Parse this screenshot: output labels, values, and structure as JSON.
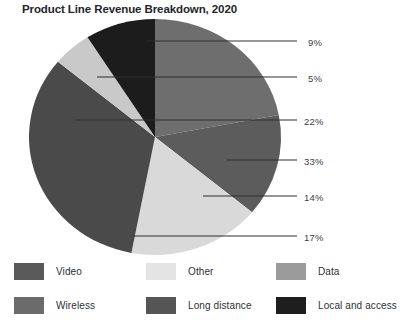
{
  "chart_data": {
    "type": "pie",
    "title": "Product Line Revenue Breakdown, 2020",
    "xlabel": "",
    "ylabel": "",
    "legend_position": "bottom",
    "grid": false,
    "units": "percent",
    "total": 100,
    "categories": [
      "Data",
      "Long distance",
      "Other",
      "Video",
      "Wireless",
      "Local and access"
    ],
    "values": [
      22,
      14,
      17,
      33,
      5,
      9
    ],
    "colors": [
      "#6e6e6e",
      "#5c5c5c",
      "#d9d9d9",
      "#4a4a4a",
      "#c9c9c9",
      "#1c1c1c"
    ],
    "slices": [
      {
        "label": "Data",
        "value": 22,
        "display": "22%",
        "color": "#6e6e6e",
        "start_deg": 0,
        "end_deg": 79.2
      },
      {
        "label": "Long distance",
        "value": 14,
        "display": "14%",
        "color": "#5c5c5c",
        "start_deg": 79.2,
        "end_deg": 129.6
      },
      {
        "label": "Other",
        "value": 17,
        "display": "17%",
        "color": "#d9d9d9",
        "start_deg": 129.6,
        "end_deg": 190.8
      },
      {
        "label": "Video",
        "value": 33,
        "display": "33%",
        "color": "#4a4a4a",
        "start_deg": 190.8,
        "end_deg": 309.6
      },
      {
        "label": "Wireless",
        "value": 5,
        "display": "5%",
        "color": "#c9c9c9",
        "start_deg": 309.6,
        "end_deg": 327.6
      },
      {
        "label": "Local and access",
        "value": 9,
        "display": "9%",
        "color": "#1c1c1c",
        "start_deg": 327.6,
        "end_deg": 360
      }
    ]
  },
  "title": "Product Line Revenue Breakdown, 2020",
  "callouts": [
    {
      "display": "9%",
      "label_x": 308,
      "label_y": 21,
      "line_x1": 147,
      "line_x2": 297,
      "line_y": 25
    },
    {
      "display": "5%",
      "label_x": 308,
      "label_y": 57,
      "line_x1": 97,
      "line_x2": 297,
      "line_y": 61
    },
    {
      "display": "22%",
      "label_x": 304,
      "label_y": 100,
      "line_x1": 76,
      "line_x2": 297,
      "line_y": 104
    },
    {
      "display": "33%",
      "label_x": 304,
      "label_y": 140,
      "line_x1": 227,
      "line_x2": 297,
      "line_y": 144
    },
    {
      "display": "14%",
      "label_x": 304,
      "label_y": 176,
      "line_x1": 203,
      "line_x2": 297,
      "line_y": 180
    },
    {
      "display": "17%",
      "label_x": 304,
      "label_y": 216,
      "line_x1": 133,
      "line_x2": 297,
      "line_y": 220
    }
  ],
  "legend": {
    "rows": [
      [
        {
          "label": "Video",
          "color": "#5a5a5a"
        },
        {
          "label": "Other",
          "color": "#e4e4e4"
        },
        {
          "label": "Data",
          "color": "#9b9b9b"
        }
      ],
      [
        {
          "label": "Wireless",
          "color": "#6b6b6b"
        },
        {
          "label": "Long distance",
          "color": "#555555"
        },
        {
          "label": "Local and access",
          "color": "#1e1e1e"
        }
      ]
    ]
  }
}
